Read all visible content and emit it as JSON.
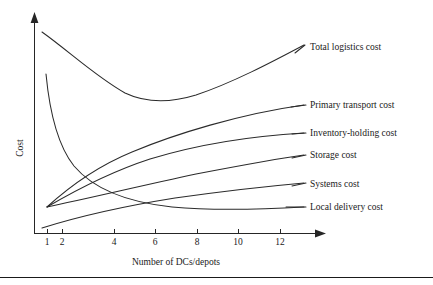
{
  "chart_data": {
    "type": "line",
    "title": "",
    "xlabel": "Number of DCs/depots",
    "ylabel": "Cost",
    "grid": false,
    "legend_position": "right-inline-labels",
    "x_ticks": [
      {
        "label": "1",
        "px": 47
      },
      {
        "label": "2",
        "px": 62
      },
      {
        "label": "4",
        "px": 114
      },
      {
        "label": "6",
        "px": 155
      },
      {
        "label": "8",
        "px": 197
      },
      {
        "label": "10",
        "px": 238
      },
      {
        "label": "12",
        "px": 280
      }
    ],
    "y_ticks": [],
    "xlim": [
      0,
      13
    ],
    "ylim": [
      0,
      100
    ],
    "series": [
      {
        "name": "Total logistics cost",
        "label": "Total logistics cost",
        "shape": "u-curve-minimum-near-6",
        "path": "M 42,32 C 70,52 95,76 125,93 C 146,103 170,103 196,95 C 232,83 272,62 304,45",
        "label_x": 310,
        "label_y": 50,
        "leader": "M 295,53 L 305,45"
      },
      {
        "name": "Primary transport cost",
        "label": "Primary transport cost",
        "shape": "rising-concave",
        "path": "M 47,207 C 70,186 98,166 132,152 C 175,134 240,114 304,105",
        "label_x": 310,
        "label_y": 108,
        "leader": "M 291,107 L 306,105"
      },
      {
        "name": "Inventory-holding cost",
        "label": "Inventory-holding cost",
        "shape": "rising-saturating",
        "path": "M 47,207 C 76,190 110,172 150,159 C 196,145 252,136 304,133",
        "label_x": 310,
        "label_y": 136,
        "leader": "M 292,134 L 306,133"
      },
      {
        "name": "Storage cost",
        "label": "Storage cost",
        "shape": "rising-gentle",
        "path": "M 47,207 C 90,198 140,186 196,174 C 238,166 275,159 304,155",
        "label_x": 310,
        "label_y": 158,
        "leader": "M 292,158 L 306,155"
      },
      {
        "name": "Systems cost",
        "label": "Systems cost",
        "shape": "rising-shallow",
        "path": "M 42,228 C 80,216 125,206 175,198 C 225,191 270,186 304,183",
        "label_x": 310,
        "label_y": 187,
        "leader": "M 292,186 L 306,183"
      },
      {
        "name": "Local delivery cost",
        "label": "Local delivery cost",
        "shape": "steep-decay",
        "path": "M 46,74 C 50,116 58,146 74,166 C 96,192 134,203 172,207 C 216,211 268,209 304,207",
        "label_x": 310,
        "label_y": 210,
        "leader": "M 286,207 L 306,207"
      }
    ]
  },
  "axes": {
    "y_axis_label": "Cost",
    "x_axis_label": "Number of DCs/depots",
    "y_axis_arrow": "arrow-up",
    "x_axis_arrow": "arrow-right"
  },
  "icons": {
    "y_axis_arrow": "arrow-up-icon",
    "x_axis_arrow": "arrow-right-icon"
  }
}
